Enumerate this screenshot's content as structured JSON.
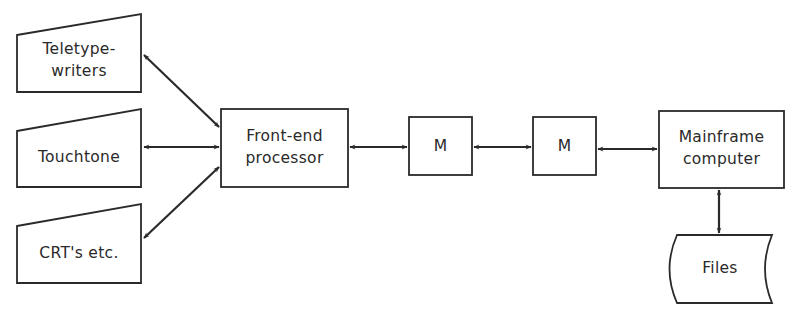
{
  "diagram": {
    "nodes": {
      "teletype": {
        "label": "Teletype-\nwriters",
        "shape": "trapezoid-terminal"
      },
      "touchtone": {
        "label": "Touchtone",
        "shape": "trapezoid-terminal"
      },
      "crt": {
        "label": "CRT's etc.",
        "shape": "trapezoid-terminal"
      },
      "frontend": {
        "label": "Front-end\nprocessor",
        "shape": "rectangle"
      },
      "modem1": {
        "label": "M",
        "shape": "rectangle"
      },
      "modem2": {
        "label": "M",
        "shape": "rectangle"
      },
      "mainframe": {
        "label": "Mainframe\ncomputer",
        "shape": "rectangle"
      },
      "files": {
        "label": "Files",
        "shape": "stored-data"
      }
    },
    "edges": [
      {
        "from": "teletype",
        "to": "frontend",
        "direction": "bidirectional"
      },
      {
        "from": "touchtone",
        "to": "frontend",
        "direction": "bidirectional"
      },
      {
        "from": "crt",
        "to": "frontend",
        "direction": "bidirectional"
      },
      {
        "from": "frontend",
        "to": "modem1",
        "direction": "bidirectional"
      },
      {
        "from": "modem1",
        "to": "modem2",
        "direction": "bidirectional"
      },
      {
        "from": "modem2",
        "to": "mainframe",
        "direction": "bidirectional"
      },
      {
        "from": "mainframe",
        "to": "files",
        "direction": "bidirectional"
      }
    ],
    "colors": {
      "stroke": "#2a2a2a",
      "background": "#ffffff"
    }
  }
}
